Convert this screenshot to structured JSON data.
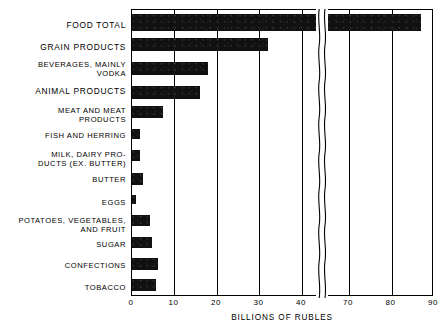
{
  "chart_data": {
    "type": "bar",
    "orientation": "horizontal",
    "title": "",
    "subtitle": "",
    "xlabel": "BILLIONS OF RUBLES",
    "ylabel": "",
    "xlim": [
      0,
      90
    ],
    "grid": true,
    "legend": null,
    "axis_break": {
      "from": 43.5,
      "to": 65.0,
      "style": "wavy"
    },
    "xticks": [
      0,
      10,
      20,
      30,
      40,
      70,
      80,
      90
    ],
    "xtick_labels": [
      "0",
      "10",
      "20",
      "30",
      "40",
      "70",
      "80",
      "90"
    ],
    "categories": [
      "FOOD TOTAL",
      "GRAIN PRODUCTS",
      "BEVERAGES, MAINLY\nVODKA",
      "ANIMAL PRODUCTS",
      "MEAT AND MEAT\nPRODUCTS",
      "FISH AND HERRING",
      "MILK, DAIRY PRO-\nDUCTS  (EX. BUTTER)",
      "BUTTER",
      "EGGS",
      "POTATOES, VEGETABLES,\nAND FRUIT",
      "SUGAR",
      "CONFECTIONS",
      "TOBACCO"
    ],
    "values": [
      87,
      32,
      18,
      16,
      7.3,
      2.0,
      2.0,
      2.6,
      1.0,
      4.3,
      4.8,
      6.2,
      5.7
    ],
    "bars": [
      {
        "label": "FOOD TOTAL",
        "value": 87,
        "emphasis": "major"
      },
      {
        "label": "GRAIN PRODUCTS",
        "value": 32,
        "emphasis": "major"
      },
      {
        "label": "BEVERAGES, MAINLY VODKA",
        "value": 18,
        "emphasis": "major"
      },
      {
        "label": "ANIMAL PRODUCTS",
        "value": 16,
        "emphasis": "major"
      },
      {
        "label": "MEAT AND MEAT PRODUCTS",
        "value": 7.3,
        "emphasis": "sub"
      },
      {
        "label": "FISH AND HERRING",
        "value": 2.0,
        "emphasis": "sub"
      },
      {
        "label": "MILK, DAIRY PRODUCTS (EX. BUTTER)",
        "value": 2.0,
        "emphasis": "sub"
      },
      {
        "label": "BUTTER",
        "value": 2.6,
        "emphasis": "sub"
      },
      {
        "label": "EGGS",
        "value": 1.0,
        "emphasis": "sub"
      },
      {
        "label": "POTATOES, VEGETABLES, AND FRUIT",
        "value": 4.3,
        "emphasis": "sub"
      },
      {
        "label": "SUGAR",
        "value": 4.8,
        "emphasis": "sub"
      },
      {
        "label": "CONFECTIONS",
        "value": 6.2,
        "emphasis": "sub"
      },
      {
        "label": "TOBACCO",
        "value": 5.7,
        "emphasis": "major"
      }
    ],
    "colors": {
      "bar": "#111111",
      "axis": "#000000",
      "background": "#ffffff"
    }
  },
  "labels": {
    "l0": "FOOD TOTAL",
    "l1": "GRAIN PRODUCTS",
    "l2": "BEVERAGES, MAINLY\nVODKA",
    "l3": "ANIMAL PRODUCTS",
    "l4": "MEAT AND MEAT\nPRODUCTS",
    "l5": "FISH AND HERRING",
    "l6": "MILK, DAIRY PRO-\nDUCTS  (EX. BUTTER)",
    "l7": "BUTTER",
    "l8": "EGGS",
    "l9": "POTATOES, VEGETABLES,\nAND FRUIT",
    "l10": "SUGAR",
    "l11": "CONFECTIONS",
    "l12": "TOBACCO"
  },
  "xticks": {
    "t0": "0",
    "t1": "10",
    "t2": "20",
    "t3": "30",
    "t4": "40",
    "t5": "70",
    "t6": "80",
    "t7": "90"
  },
  "axis_title": "BILLIONS OF RUBLES"
}
